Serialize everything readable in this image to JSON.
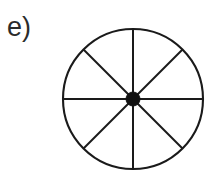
{
  "figure": {
    "panel_label": "e)",
    "background_color": "#ffffff",
    "stroke_color": "#1a1a1a",
    "label_color": "#2b2b2b"
  },
  "chart_data": {
    "type": "pie",
    "title": "e)",
    "xlabel": "",
    "ylabel": "",
    "categories": [
      "sector 1",
      "sector 2",
      "sector 3",
      "sector 4",
      "sector 5",
      "sector 6",
      "sector 7",
      "sector 8"
    ],
    "values": [
      12.5,
      12.5,
      12.5,
      12.5,
      12.5,
      12.5,
      12.5,
      12.5
    ],
    "value_unit": "%",
    "slice_count": 8,
    "slice_angle_deg": 45,
    "slice_angles_deg": [
      0,
      45,
      90,
      135,
      180,
      225,
      270,
      315
    ],
    "fill": "none",
    "stroke": "#1a1a1a",
    "stroke_width": 2,
    "legend": "none",
    "grid": false,
    "center_marker": {
      "shape": "filled-circle",
      "color": "#111111",
      "radius_px": 7
    },
    "geometry": {
      "cx": 133,
      "cy": 99,
      "r": 70
    }
  }
}
